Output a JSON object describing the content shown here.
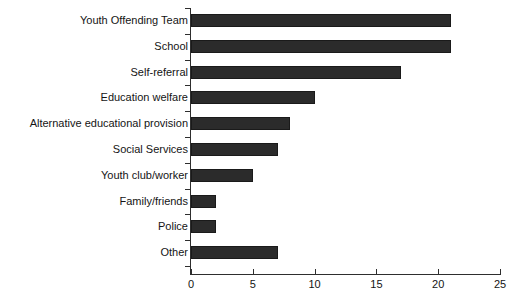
{
  "chart_data": {
    "type": "bar",
    "orientation": "horizontal",
    "title": "",
    "subtitle": "",
    "xlabel": "",
    "ylabel": "",
    "xlim": [
      0,
      25
    ],
    "xticks": [
      0,
      5,
      10,
      15,
      20,
      25
    ],
    "xtick_labels": [
      "0",
      "5",
      "10",
      "15",
      "20",
      "25"
    ],
    "grid": false,
    "legend": null,
    "bar_color": "#2b2b2b",
    "axis_color": "#2e2e2e",
    "background_color": "#ffffff",
    "categories": [
      "Youth Offending Team",
      "School",
      "Self-referral",
      "Education welfare",
      "Alternative educational provision",
      "Social Services",
      "Youth club/worker",
      "Family/friends",
      "Police",
      "Other"
    ],
    "values": [
      21,
      21,
      17,
      10,
      8,
      7,
      5,
      2,
      2,
      7
    ]
  }
}
